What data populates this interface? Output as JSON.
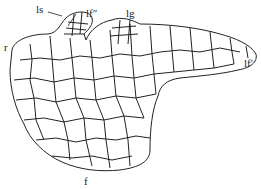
{
  "figure": {
    "type": "botanical cell diagram",
    "labels": {
      "ls": "ls",
      "f_double": "lf″",
      "lg": "lg",
      "r": "r",
      "f_prime": "lf'",
      "f": "f"
    },
    "colors": {
      "line": "#222222",
      "background": "#ffffff"
    }
  }
}
